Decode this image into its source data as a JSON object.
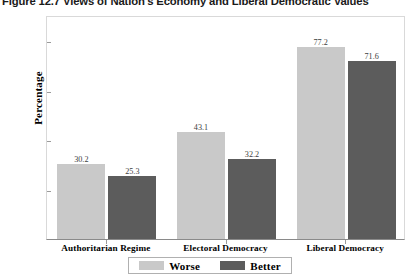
{
  "chart_data": {
    "type": "bar",
    "title": "Figure 12.7 Views of Nation's Economy and Liberal Democratic Values",
    "xlabel": "",
    "ylabel": "Percentage",
    "ylim": [
      0,
      90
    ],
    "yticks": [
      20,
      40,
      60,
      80
    ],
    "ytick_labels": [
      "20",
      "40",
      "60",
      "80"
    ],
    "grid": false,
    "legend_position": "bottom",
    "categories": [
      "Authoritarian Regime",
      "Electoral Democracy",
      "Liberal Democracy"
    ],
    "series": [
      {
        "name": "Worse",
        "color": "#c9c9c9",
        "values": [
          30.2,
          43.1,
          77.2
        ],
        "labels": [
          "30.2",
          "43.1",
          "77.2"
        ]
      },
      {
        "name": "Better",
        "color": "#5c5c5c",
        "values": [
          25.3,
          32.2,
          71.6
        ],
        "labels": [
          "25.3",
          "32.2",
          "71.6"
        ]
      }
    ]
  },
  "legend": {
    "items": [
      {
        "label": "Worse",
        "color": "#c9c9c9"
      },
      {
        "label": "Better",
        "color": "#5c5c5c"
      }
    ]
  },
  "colors": {
    "worse": "#c9c9c9",
    "better": "#5c5c5c",
    "axis": "#8a8a8a",
    "frame": "#d9d9d9",
    "value_text": "#3d3d3d"
  }
}
